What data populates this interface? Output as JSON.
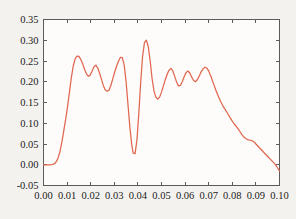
{
  "chart_data": {
    "type": "line",
    "title": "",
    "xlabel": "",
    "ylabel": "",
    "xlim": [
      0.0,
      0.1
    ],
    "ylim": [
      -0.05,
      0.35
    ],
    "grid": false,
    "legend": null,
    "line_color": "#e0664f",
    "background_color": "#f4f2ef",
    "axis_color": "#5b5b5b",
    "xticks": [
      0.0,
      0.01,
      0.02,
      0.03,
      0.04,
      0.05,
      0.06,
      0.07,
      0.08,
      0.09,
      0.1
    ],
    "xtick_labels": [
      "0.00",
      "0.01",
      "0.02",
      "0.03",
      "0.04",
      "0.05",
      "0.06",
      "0.07",
      "0.08",
      "0.09",
      "0.10"
    ],
    "yticks": [
      -0.05,
      0.0,
      0.05,
      0.1,
      0.15,
      0.2,
      0.25,
      0.3,
      0.35
    ],
    "ytick_labels": [
      "-0.05",
      "0.00",
      "0.05",
      "0.10",
      "0.15",
      "0.20",
      "0.25",
      "0.30",
      "0.35"
    ],
    "series": [
      {
        "name": "signal",
        "color": "#e0664f",
        "x": [
          0.0,
          0.001,
          0.002,
          0.003,
          0.004,
          0.0048,
          0.0055,
          0.0062,
          0.007,
          0.0078,
          0.0086,
          0.0094,
          0.0102,
          0.011,
          0.0118,
          0.0126,
          0.0134,
          0.0142,
          0.015,
          0.0158,
          0.0166,
          0.0174,
          0.0182,
          0.019,
          0.0198,
          0.0206,
          0.0214,
          0.0222,
          0.023,
          0.0238,
          0.0246,
          0.0254,
          0.0262,
          0.027,
          0.0278,
          0.0286,
          0.0294,
          0.0302,
          0.031,
          0.0318,
          0.0326,
          0.0334,
          0.0342,
          0.035,
          0.0358,
          0.0366,
          0.0374,
          0.038,
          0.0388,
          0.0396,
          0.0404,
          0.0412,
          0.042,
          0.0428,
          0.0436,
          0.0444,
          0.0452,
          0.046,
          0.0468,
          0.0476,
          0.0484,
          0.0492,
          0.05,
          0.0508,
          0.0516,
          0.0524,
          0.0532,
          0.054,
          0.0548,
          0.0556,
          0.0564,
          0.0572,
          0.058,
          0.0588,
          0.0596,
          0.0604,
          0.0612,
          0.062,
          0.0628,
          0.0636,
          0.0644,
          0.0652,
          0.066,
          0.0668,
          0.0676,
          0.0684,
          0.0692,
          0.07,
          0.071,
          0.072,
          0.073,
          0.074,
          0.075,
          0.076,
          0.077,
          0.078,
          0.079,
          0.08,
          0.081,
          0.082,
          0.083,
          0.084,
          0.085,
          0.086,
          0.0868,
          0.0876,
          0.0884,
          0.0892,
          0.09,
          0.091,
          0.092,
          0.093,
          0.094,
          0.095,
          0.096,
          0.097,
          0.098,
          0.099,
          0.1
        ],
        "y": [
          0.0,
          0.0,
          0.0,
          0.0,
          0.001,
          0.003,
          0.008,
          0.017,
          0.032,
          0.055,
          0.082,
          0.11,
          0.14,
          0.175,
          0.21,
          0.238,
          0.255,
          0.262,
          0.261,
          0.254,
          0.243,
          0.23,
          0.219,
          0.213,
          0.216,
          0.226,
          0.236,
          0.24,
          0.233,
          0.22,
          0.205,
          0.19,
          0.18,
          0.177,
          0.18,
          0.192,
          0.208,
          0.224,
          0.238,
          0.25,
          0.259,
          0.258,
          0.24,
          0.2,
          0.145,
          0.09,
          0.048,
          0.028,
          0.027,
          0.06,
          0.125,
          0.2,
          0.262,
          0.295,
          0.3,
          0.285,
          0.25,
          0.208,
          0.178,
          0.163,
          0.158,
          0.163,
          0.175,
          0.19,
          0.205,
          0.218,
          0.228,
          0.232,
          0.226,
          0.213,
          0.199,
          0.19,
          0.191,
          0.2,
          0.212,
          0.222,
          0.226,
          0.221,
          0.211,
          0.203,
          0.2,
          0.205,
          0.214,
          0.224,
          0.231,
          0.235,
          0.233,
          0.226,
          0.212,
          0.196,
          0.18,
          0.166,
          0.153,
          0.142,
          0.133,
          0.124,
          0.114,
          0.105,
          0.097,
          0.09,
          0.082,
          0.073,
          0.066,
          0.062,
          0.06,
          0.059,
          0.058,
          0.055,
          0.05,
          0.044,
          0.038,
          0.032,
          0.026,
          0.02,
          0.014,
          0.008,
          0.002,
          -0.006,
          -0.015
        ]
      }
    ]
  }
}
